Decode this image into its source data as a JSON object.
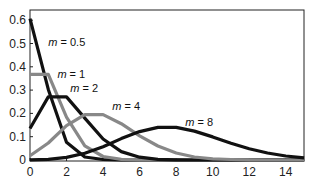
{
  "chart_data": {
    "type": "line",
    "title": "",
    "xlabel": "",
    "ylabel": "",
    "xlim": [
      0,
      15
    ],
    "ylim": [
      0,
      0.65
    ],
    "grid": false,
    "legend_position": "inline labels",
    "x_ticks": [
      "0",
      "2",
      "4",
      "6",
      "8",
      "10",
      "12",
      "14"
    ],
    "y_ticks": [
      "0",
      "0.1",
      "0.2",
      "0.3",
      "0.4",
      "0.5",
      "0.6"
    ],
    "x": [
      0,
      1,
      2,
      3,
      4,
      5,
      6,
      7,
      8,
      9,
      10,
      11,
      12,
      13,
      14,
      15
    ],
    "series": [
      {
        "name": "m = 0.5",
        "color": "#111111",
        "values": [
          0.607,
          0.303,
          0.076,
          0.013,
          0.002,
          0,
          0,
          0,
          0,
          0,
          0,
          0,
          0,
          0,
          0,
          0
        ]
      },
      {
        "name": "m = 1",
        "color": "#888888",
        "values": [
          0.368,
          0.368,
          0.184,
          0.061,
          0.015,
          0.003,
          0.001,
          0,
          0,
          0,
          0,
          0,
          0,
          0,
          0,
          0
        ]
      },
      {
        "name": "m = 2",
        "color": "#111111",
        "values": [
          0.135,
          0.271,
          0.271,
          0.18,
          0.09,
          0.036,
          0.012,
          0.003,
          0.001,
          0,
          0,
          0,
          0,
          0,
          0,
          0
        ]
      },
      {
        "name": "m = 4",
        "color": "#888888",
        "values": [
          0.018,
          0.073,
          0.147,
          0.195,
          0.195,
          0.156,
          0.104,
          0.06,
          0.03,
          0.013,
          0.005,
          0.002,
          0.001,
          0,
          0,
          0
        ]
      },
      {
        "name": "m = 8",
        "color": "#111111",
        "values": [
          0.0003,
          0.003,
          0.011,
          0.029,
          0.057,
          0.092,
          0.122,
          0.14,
          0.14,
          0.124,
          0.099,
          0.072,
          0.048,
          0.03,
          0.017,
          0.009
        ]
      }
    ],
    "annotations": [
      {
        "text_prefix": "m",
        "text_suffix": " = 0.5",
        "x": 1.0,
        "y": 0.49
      },
      {
        "text_prefix": "m",
        "text_suffix": " = 1",
        "x": 1.5,
        "y": 0.35
      },
      {
        "text_prefix": "m",
        "text_suffix": " = 2",
        "x": 2.2,
        "y": 0.29
      },
      {
        "text_prefix": "m",
        "text_suffix": " = 4",
        "x": 4.5,
        "y": 0.215
      },
      {
        "text_prefix": "m",
        "text_suffix": " = 8",
        "x": 8.5,
        "y": 0.145
      }
    ]
  }
}
